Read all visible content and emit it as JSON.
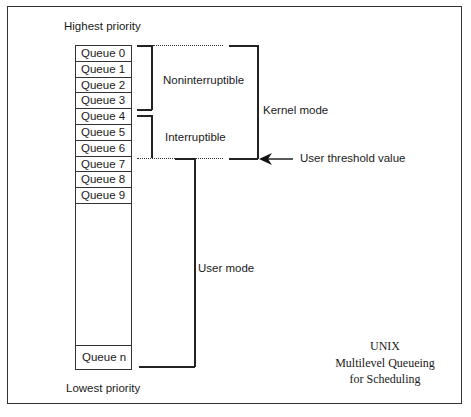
{
  "diagram": {
    "top_label": "Highest priority",
    "bottom_label": "Lowest priority",
    "queues": [
      "Queue 0",
      "Queue 1",
      "Queue 2",
      "Queue 3",
      "Queue 4",
      "Queue 5",
      "Queue 6",
      "Queue 7",
      "Queue 8",
      "Queue 9"
    ],
    "last_queue": "Queue n",
    "groups": {
      "noninterruptible": "Noninterruptible",
      "interruptible": "Interruptible",
      "kernel_mode": "Kernel mode",
      "user_mode": "User mode"
    },
    "threshold_label": "User threshold value",
    "caption": {
      "line1": "UNIX",
      "line2": "Multilevel Queueing",
      "line3": "for Scheduling"
    }
  }
}
